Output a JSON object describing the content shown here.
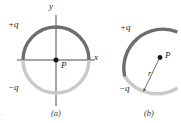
{
  "figure": {
    "panels": [
      {
        "id": "a",
        "caption": "(a)",
        "type": "full-ring",
        "center_label": "P",
        "axis_labels": {
          "x": "x",
          "y": "y"
        },
        "charge_labels": {
          "positive": "+q",
          "negative": "−q"
        },
        "geometry": {
          "center_x": 56,
          "center_y": 60,
          "radius": 33,
          "upper_arc_degrees": 180,
          "lower_arc_degrees": 180
        }
      },
      {
        "id": "b",
        "caption": "(b)",
        "type": "arc",
        "point_label": "P",
        "radius_label": "r",
        "charge_labels": {
          "positive": "+q",
          "negative": "−q"
        },
        "geometry": {
          "center_x": 160,
          "center_y": 60,
          "radius": 39,
          "arc_start_degrees": 155,
          "arc_end_degrees": 245
        }
      }
    ],
    "colors": {
      "positive_charge_arc": "#6e6e70",
      "negative_charge_arc": "#c9c9cb",
      "axis": "#3a3738",
      "point_marker": "#1a1718",
      "radius_line": "#4a4748",
      "label_text": "#231f20",
      "caption_text": "#3c3a3b",
      "background": "#ffffff"
    },
    "stray_mark": "·"
  }
}
